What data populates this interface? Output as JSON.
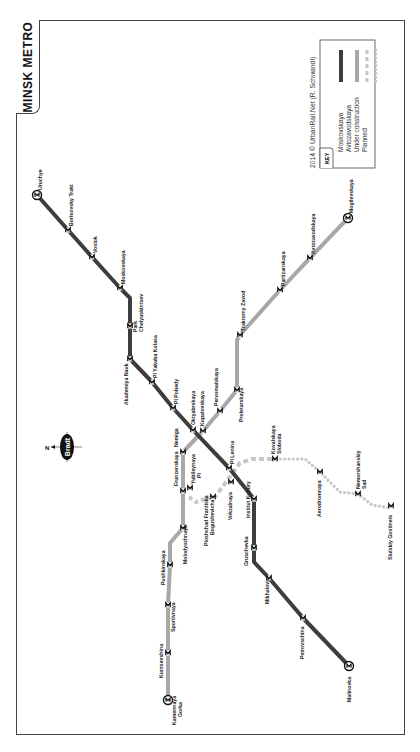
{
  "map": {
    "title": "MINSK METRO",
    "credit": "2014 © UrbanRail.Net (R. Schwandl)",
    "compass": {
      "north_label": "N",
      "logo_text": "Bradt"
    },
    "colors": {
      "moskovskaya": "#3d3d3d",
      "avtozavodskaya": "#a8a8a8",
      "under_construction": "#c4c4c4",
      "planned": "#c4c4c4",
      "frame": "#444444"
    },
    "key": {
      "heading": "KEY",
      "items": [
        {
          "label": "Moskovskaya",
          "style": "solid-dark"
        },
        {
          "label": "Avtozavodskaya",
          "style": "solid-light"
        },
        {
          "label": "Under construction",
          "style": "dashed"
        },
        {
          "label": "Planned",
          "style": "dotted"
        }
      ]
    },
    "lines": {
      "moskovskaya": {
        "name": "Moskovskaya",
        "stations": [
          "Uruchye",
          "Borisovsky Trakt",
          "Vostok",
          "Moskovskaya",
          "Park Chelyuskintsev",
          "Akademiya Nauk",
          "Pl Yakuba Kolasa",
          "Pl Pobedy",
          "Oktyabrskaya",
          "Pl Lenina",
          "Institut Kultury",
          "Gruschevka",
          "Mikhalovo",
          "Petrovschina",
          "Malinovka"
        ]
      },
      "avtozavodskaya": {
        "name": "Avtozavodskaya",
        "stations": [
          "Mogilevskaya",
          "Avtozavodskaya",
          "Partizanskaya",
          "Traktorny Zavod",
          "Proletarskaya",
          "Pervomaiskaya",
          "Kupalovskaya",
          "Nemiga",
          "Frunzenskaya",
          "Molodyozhnaya",
          "Pushkinskaya",
          "Sportivnaya",
          "Kuntsevshina",
          "Kamennaya Gorka"
        ]
      },
      "line3": {
        "name": "Under construction / Planned",
        "stations": [
          "Yubileynaya Pl",
          "Ploshchad Frantiska Bogushevicha",
          "Vokzalnaya",
          "Kovalskaya Sloboda",
          "Aerodromnaya",
          "Nemorshanskiy Sad",
          "Slutskiy Gostinets"
        ]
      }
    },
    "labels": {
      "uruchye": "Uruchye",
      "borisovsky": "Borisovsky Trakt",
      "vostok": "Vostok",
      "moskovskaya": "Moskovskaya",
      "park1": "Park",
      "park2": "Chelyuskintsev",
      "akademiya": "Akademiya Nauk",
      "kolasa": "Pl Yakuba Kolasa",
      "pobedy": "Pl Pobedy",
      "oktyabrskaya": "Oktyabrskaya",
      "lenina": "Pl Lenina",
      "institut": "Institut Kultury",
      "gruschevka": "Gruschevka",
      "mikhalovo": "Mikhalovo",
      "petrovschina": "Petrovschina",
      "malinovka": "Malinovka",
      "mogilevskaya": "Mogilevskaya",
      "avtozavodskaya": "Avtozavodskaya",
      "partizanskaya": "Partizanskaya",
      "traktorny": "Traktorny Zavod",
      "proletarskaya": "Proletarskaya",
      "pervomaiskaya": "Pervomaiskaya",
      "kupalovskaya": "Kupalovskaya",
      "nemiga": "Nemiga",
      "frunzenskaya": "Frunzenskaya",
      "molodyozhnaya": "Molodyozhnaya",
      "pushkinskaya": "Pushkinskaya",
      "sportivnaya": "Sportivnaya",
      "kuntsevshina": "Kuntsevshina",
      "gorka1": "Kamennaya",
      "gorka2": "Gorka",
      "yubileynaya1": "Yubileynaya",
      "yubileynaya2": "Pl",
      "bogushevicha1": "Ploshchad Frantiska",
      "bogushevicha2": "Bogushevicha",
      "vokzalnaya": "Vokzalnaya",
      "kovalskaya1": "Kovalskaya",
      "kovalskaya2": "Sloboda",
      "aerodromnaya": "Aerodromnaya",
      "nemorshanskiy1": "Nemorshanskiy",
      "nemorshanskiy2": "Sad",
      "slutskiy": "Slutskiy Gostinets"
    }
  }
}
